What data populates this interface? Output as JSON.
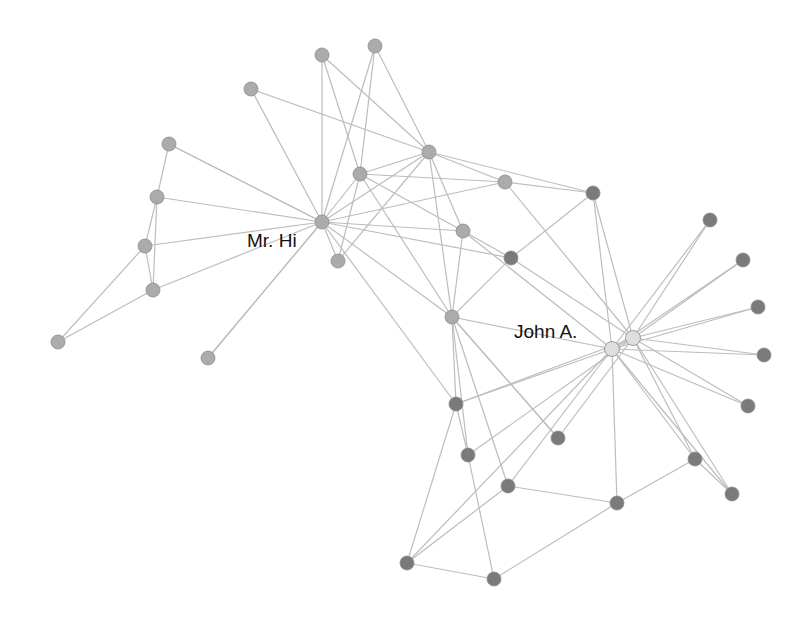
{
  "graph": {
    "title": "",
    "colors": {
      "group_a": "#ababab",
      "group_b": "#7a7a7a",
      "leader": "#dedede",
      "edge": "#bdbdbd"
    },
    "labels": [
      {
        "id": "mrhi",
        "text": "Mr. Hi",
        "x": 247,
        "y": 232
      },
      {
        "id": "johna",
        "text": "John A.",
        "x": 514,
        "y": 323
      }
    ],
    "nodes": [
      {
        "id": 0,
        "x": 322,
        "y": 222,
        "g": "a"
      },
      {
        "id": 1,
        "x": 360,
        "y": 174,
        "g": "a"
      },
      {
        "id": 2,
        "x": 429,
        "y": 152,
        "g": "a"
      },
      {
        "id": 3,
        "x": 463,
        "y": 231,
        "g": "a"
      },
      {
        "id": 4,
        "x": 338,
        "y": 261,
        "g": "a"
      },
      {
        "id": 5,
        "x": 452,
        "y": 317,
        "g": "a"
      },
      {
        "id": 6,
        "x": 505,
        "y": 182,
        "g": "a"
      },
      {
        "id": 7,
        "x": 322,
        "y": 55,
        "g": "a"
      },
      {
        "id": 8,
        "x": 375,
        "y": 46,
        "g": "a"
      },
      {
        "id": 9,
        "x": 251,
        "y": 89,
        "g": "a"
      },
      {
        "id": 10,
        "x": 169,
        "y": 144,
        "g": "a"
      },
      {
        "id": 11,
        "x": 157,
        "y": 197,
        "g": "a"
      },
      {
        "id": 12,
        "x": 145,
        "y": 246,
        "g": "a"
      },
      {
        "id": 13,
        "x": 153,
        "y": 290,
        "g": "a"
      },
      {
        "id": 14,
        "x": 58,
        "y": 342,
        "g": "a"
      },
      {
        "id": 15,
        "x": 208,
        "y": 358,
        "g": "a"
      },
      {
        "id": 16,
        "x": 593,
        "y": 193,
        "g": "b"
      },
      {
        "id": 17,
        "x": 511,
        "y": 258,
        "g": "b"
      },
      {
        "id": 18,
        "x": 710,
        "y": 220,
        "g": "b"
      },
      {
        "id": 19,
        "x": 743,
        "y": 260,
        "g": "b"
      },
      {
        "id": 20,
        "x": 758,
        "y": 307,
        "g": "b"
      },
      {
        "id": 21,
        "x": 764,
        "y": 355,
        "g": "b"
      },
      {
        "id": 22,
        "x": 748,
        "y": 406,
        "g": "b"
      },
      {
        "id": 23,
        "x": 456,
        "y": 404,
        "g": "b"
      },
      {
        "id": 24,
        "x": 468,
        "y": 455,
        "g": "b"
      },
      {
        "id": 25,
        "x": 558,
        "y": 438,
        "g": "b"
      },
      {
        "id": 26,
        "x": 508,
        "y": 486,
        "g": "b"
      },
      {
        "id": 27,
        "x": 617,
        "y": 503,
        "g": "b"
      },
      {
        "id": 28,
        "x": 695,
        "y": 459,
        "g": "b"
      },
      {
        "id": 29,
        "x": 732,
        "y": 494,
        "g": "b"
      },
      {
        "id": 30,
        "x": 407,
        "y": 563,
        "g": "b"
      },
      {
        "id": 31,
        "x": 494,
        "y": 579,
        "g": "b"
      },
      {
        "id": 32,
        "x": 612,
        "y": 349,
        "g": "l"
      },
      {
        "id": 33,
        "x": 633,
        "y": 338,
        "g": "l"
      }
    ],
    "edges": [
      [
        0,
        1
      ],
      [
        0,
        2
      ],
      [
        0,
        3
      ],
      [
        0,
        4
      ],
      [
        0,
        5
      ],
      [
        0,
        6
      ],
      [
        0,
        7
      ],
      [
        0,
        9
      ],
      [
        0,
        10
      ],
      [
        0,
        11
      ],
      [
        0,
        12
      ],
      [
        0,
        13
      ],
      [
        0,
        15
      ],
      [
        0,
        17
      ],
      [
        0,
        23
      ],
      [
        1,
        2
      ],
      [
        1,
        3
      ],
      [
        1,
        5
      ],
      [
        1,
        6
      ],
      [
        1,
        7
      ],
      [
        1,
        8
      ],
      [
        1,
        4
      ],
      [
        2,
        3
      ],
      [
        2,
        4
      ],
      [
        2,
        5
      ],
      [
        2,
        6
      ],
      [
        2,
        8
      ],
      [
        2,
        9
      ],
      [
        2,
        16
      ],
      [
        3,
        5
      ],
      [
        3,
        17
      ],
      [
        3,
        32
      ],
      [
        5,
        23
      ],
      [
        5,
        32
      ],
      [
        5,
        24
      ],
      [
        5,
        25
      ],
      [
        5,
        17
      ],
      [
        6,
        16
      ],
      [
        6,
        33
      ],
      [
        7,
        2
      ],
      [
        8,
        0
      ],
      [
        10,
        11
      ],
      [
        10,
        0
      ],
      [
        11,
        12
      ],
      [
        11,
        13
      ],
      [
        12,
        14
      ],
      [
        13,
        14
      ],
      [
        12,
        13
      ],
      [
        15,
        0
      ],
      [
        16,
        17
      ],
      [
        16,
        32
      ],
      [
        16,
        33
      ],
      [
        17,
        33
      ],
      [
        18,
        32
      ],
      [
        18,
        33
      ],
      [
        19,
        32
      ],
      [
        19,
        33
      ],
      [
        20,
        32
      ],
      [
        20,
        33
      ],
      [
        21,
        32
      ],
      [
        21,
        33
      ],
      [
        22,
        32
      ],
      [
        22,
        33
      ],
      [
        23,
        32
      ],
      [
        23,
        33
      ],
      [
        23,
        24
      ],
      [
        23,
        30
      ],
      [
        24,
        33
      ],
      [
        24,
        31
      ],
      [
        25,
        33
      ],
      [
        25,
        5
      ],
      [
        26,
        32
      ],
      [
        26,
        30
      ],
      [
        26,
        27
      ],
      [
        26,
        5
      ],
      [
        27,
        32
      ],
      [
        27,
        28
      ],
      [
        27,
        31
      ],
      [
        28,
        32
      ],
      [
        28,
        33
      ],
      [
        28,
        29
      ],
      [
        29,
        32
      ],
      [
        29,
        33
      ],
      [
        30,
        31
      ],
      [
        30,
        32
      ],
      [
        32,
        33
      ]
    ]
  }
}
